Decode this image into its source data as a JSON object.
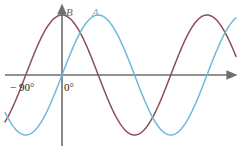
{
  "figure": {
    "background_color": "#ffffff",
    "width": 241,
    "height": 151
  },
  "axes": {
    "color": "#6e6e6e",
    "x_axis": {
      "name": "horizontal-axis",
      "y_pixel": 75,
      "x_start": 5,
      "x_end": 234,
      "arrow": "right"
    },
    "y_axis": {
      "name": "vertical-axis",
      "x_pixel": 62,
      "y_start": 146,
      "y_end": 7,
      "arrow": "up"
    },
    "tick_labels": [
      {
        "text": "− 90°",
        "x": 10,
        "y": 82
      },
      {
        "text": "0°",
        "x": 64,
        "y": 82
      }
    ]
  },
  "labels": {
    "curve_a": "A",
    "curve_b": "B",
    "tick_neg90": "− 90°",
    "tick_zero": "0°"
  },
  "colors": {
    "curve_a": "#6fb9da",
    "curve_b": "#8b4f57",
    "axis": "#6e6e6e",
    "text": "#1a1a1a"
  },
  "chart_data": {
    "type": "line",
    "title": "",
    "subtitle": "",
    "xlabel": "",
    "ylabel": "",
    "grid": false,
    "legend_position": "inline-above-curves",
    "xlim": [
      -135,
      310
    ],
    "ylim": [
      -1.15,
      1.15
    ],
    "x_tick_labels": [
      "− 90°",
      "0°"
    ],
    "x_tick_values": [
      -90,
      0
    ],
    "y_tick_labels": [],
    "annotations": [
      {
        "text": "A",
        "x": 42,
        "y": 1.12,
        "color": "#6fb9da"
      },
      {
        "text": "B",
        "x": 8,
        "y": 1.12,
        "color": "#8b4f57"
      }
    ],
    "series": [
      {
        "name": "A",
        "color": "#6fb9da",
        "function": "sin(x)",
        "amplitude": 1.0,
        "period_degrees": 360,
        "phase_degrees": 0,
        "description": "sine curve, rising zero-crossing at 0°",
        "x": [
          -135,
          -120,
          -105,
          -90,
          -75,
          -60,
          -45,
          -30,
          -15,
          0,
          15,
          30,
          45,
          60,
          75,
          90,
          105,
          120,
          135,
          150,
          165,
          180,
          195,
          210,
          225,
          240,
          255,
          270,
          285,
          300,
          310
        ],
        "values": [
          -0.707,
          -0.866,
          -0.966,
          -1.0,
          -0.966,
          -0.866,
          -0.707,
          -0.5,
          -0.259,
          0.0,
          0.259,
          0.5,
          0.707,
          0.866,
          0.966,
          1.0,
          0.966,
          0.866,
          0.707,
          0.5,
          0.259,
          0.0,
          -0.259,
          -0.5,
          -0.707,
          -0.866,
          -0.966,
          -1.0,
          -0.966,
          -0.866,
          -0.766
        ]
      },
      {
        "name": "B",
        "color": "#8b4f57",
        "function": "cos(x)",
        "amplitude": 1.0,
        "period_degrees": 360,
        "phase_degrees": 90,
        "description": "cosine curve, maximum at 0°, leads A by 90°",
        "x": [
          -135,
          -120,
          -105,
          -90,
          -75,
          -60,
          -45,
          -30,
          -15,
          0,
          15,
          30,
          45,
          60,
          75,
          90,
          105,
          120,
          135,
          150,
          165,
          180,
          195,
          210,
          225,
          240,
          255,
          270,
          285,
          300,
          310
        ],
        "values": [
          -0.707,
          -0.5,
          -0.259,
          0.0,
          0.259,
          0.5,
          0.707,
          0.866,
          0.966,
          1.0,
          0.966,
          0.866,
          0.707,
          0.5,
          0.259,
          0.0,
          -0.259,
          -0.5,
          -0.707,
          -0.866,
          -0.966,
          -1.0,
          -0.966,
          -0.866,
          -0.707,
          -0.5,
          -0.259,
          0.0,
          0.259,
          0.5,
          0.643
        ]
      }
    ]
  }
}
